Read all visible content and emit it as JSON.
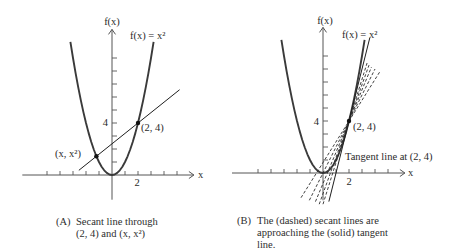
{
  "figure": {
    "panels": [
      {
        "id": "A",
        "caption_marker": "(A)",
        "caption_lines": [
          "Secant line through",
          "(2, 4) and (x, x²)"
        ]
      },
      {
        "id": "B",
        "caption_marker": "(B)",
        "caption_lines": [
          "The (dashed) secant lines are",
          "approaching the (solid) tangent",
          "line."
        ]
      }
    ]
  },
  "chart_data": [
    {
      "type": "line",
      "panel": "A",
      "title": "",
      "caption": "(A) Secant line through (2, 4) and (x, x²)",
      "xlabel": "x",
      "ylabel": "f(x)",
      "xlim": [
        -6.9,
        6.3
      ],
      "ylim": [
        -1.9,
        11.2
      ],
      "grid": false,
      "legend": "none",
      "x_ticks": [
        -5,
        -4,
        -3,
        -2,
        -1,
        1,
        2,
        3,
        4,
        5
      ],
      "y_ticks": [
        1,
        2,
        3,
        4,
        5,
        6,
        7,
        8,
        9
      ],
      "x_tick_labels": [
        {
          "value": 2,
          "label": "2"
        }
      ],
      "y_tick_labels": [
        {
          "value": 4,
          "label": "4"
        }
      ],
      "series": [
        {
          "name": "f(x) = x²",
          "style": "curve",
          "x": [
            -3.2,
            -3.0,
            -2.8,
            -2.6,
            -2.4,
            -2.2,
            -2.0,
            -1.8,
            -1.6,
            -1.4,
            -1.2,
            -1.0,
            -0.8,
            -0.6,
            -0.4,
            -0.2,
            0,
            0.2,
            0.4,
            0.6,
            0.8,
            1.0,
            1.2,
            1.4,
            1.6,
            1.8,
            2.0,
            2.2,
            2.4,
            2.6,
            2.8,
            3.0,
            3.2
          ],
          "y": [
            10.24,
            9,
            7.84,
            6.76,
            5.76,
            4.84,
            4,
            3.24,
            2.56,
            1.96,
            1.44,
            1,
            0.64,
            0.36,
            0.16,
            0.04,
            0,
            0.04,
            0.16,
            0.36,
            0.64,
            1,
            1.44,
            1.96,
            2.56,
            3.24,
            4,
            4.84,
            5.76,
            6.76,
            7.84,
            9,
            10.24
          ]
        },
        {
          "name": "Secant line",
          "style": "solid",
          "slope": 0.8,
          "from": [
            -2.55,
            0.36
          ],
          "to": [
            5.2,
            6.56
          ]
        }
      ],
      "points": [
        {
          "label": "(2, 4)",
          "x": 2,
          "y": 4
        },
        {
          "label": "(x, x²)",
          "x": -1.2,
          "y": 1.44
        }
      ],
      "annotations": []
    },
    {
      "type": "line",
      "panel": "B",
      "title": "",
      "caption": "(B) The (dashed) secant lines are approaching the (solid) tangent line.",
      "xlabel": "x",
      "ylabel": "f(x)",
      "xlim": [
        -7.0,
        6.3
      ],
      "ylim": [
        -2.1,
        11.2
      ],
      "grid": false,
      "legend": "none",
      "x_ticks": [
        -5,
        -4,
        -3,
        -2,
        -1,
        1,
        2,
        3,
        4,
        5
      ],
      "y_ticks": [
        1,
        2,
        3,
        4,
        5,
        6,
        7,
        8,
        9
      ],
      "x_tick_labels": [
        {
          "value": 2,
          "label": "2"
        }
      ],
      "y_tick_labels": [
        {
          "value": 4,
          "label": "4"
        }
      ],
      "series": [
        {
          "name": "f(x) = x²",
          "style": "curve",
          "x": [
            -3.2,
            -3.0,
            -2.8,
            -2.6,
            -2.4,
            -2.2,
            -2.0,
            -1.8,
            -1.6,
            -1.4,
            -1.2,
            -1.0,
            -0.8,
            -0.6,
            -0.4,
            -0.2,
            0,
            0.2,
            0.4,
            0.6,
            0.8,
            1.0,
            1.2,
            1.4,
            1.6,
            1.8,
            2.0,
            2.2,
            2.4,
            2.6,
            2.8,
            3.0,
            3.2
          ],
          "y": [
            10.24,
            9,
            7.84,
            6.76,
            5.76,
            4.84,
            4,
            3.24,
            2.56,
            1.96,
            1.44,
            1,
            0.64,
            0.36,
            0.16,
            0.04,
            0,
            0.04,
            0.16,
            0.36,
            0.64,
            1,
            1.44,
            1.96,
            2.56,
            3.24,
            4,
            4.84,
            5.76,
            6.76,
            7.84,
            9,
            10.24
          ]
        },
        {
          "name": "Tangent line at (2, 4)",
          "style": "solid",
          "slope": 4,
          "from": [
            0.45,
            -2.2
          ],
          "to": [
            3.6,
            10.4
          ]
        },
        {
          "name": "Secant line",
          "style": "dashed",
          "slope": 1.6,
          "from": [
            -1.69,
            -1.9
          ],
          "to": [
            4.41,
            7.85
          ]
        },
        {
          "name": "Secant line",
          "style": "dashed",
          "slope": 2.0,
          "from": [
            -1.05,
            -2.1
          ],
          "to": [
            4.0,
            8.0
          ]
        },
        {
          "name": "Secant line",
          "style": "dashed",
          "slope": 2.4,
          "from": [
            -0.58,
            -2.2
          ],
          "to": [
            3.73,
            8.15
          ]
        },
        {
          "name": "Secant line",
          "style": "dashed",
          "slope": 2.8,
          "from": [
            -0.29,
            -2.4
          ],
          "to": [
            3.54,
            8.3
          ]
        },
        {
          "name": "Secant line",
          "style": "dashed",
          "slope": 3.2,
          "from": [
            0.0,
            -2.4
          ],
          "to": [
            3.39,
            8.46
          ]
        }
      ],
      "points": [
        {
          "label": "(2, 4)",
          "x": 2,
          "y": 4
        }
      ],
      "annotations": [
        {
          "text": "Tangent line at (2, 4)"
        }
      ]
    }
  ]
}
